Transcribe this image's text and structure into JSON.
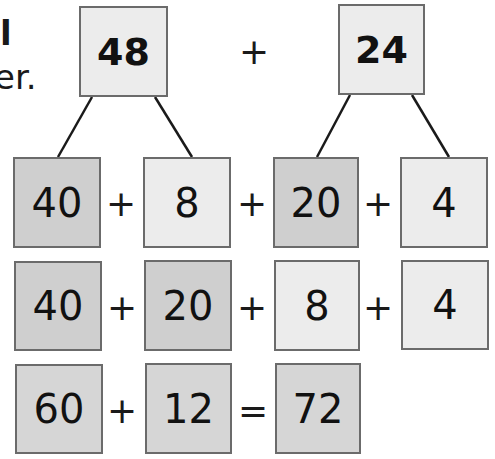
{
  "partial_text": {
    "line1": "l",
    "line2": "er."
  },
  "top": {
    "left_number": "48",
    "operator": "+",
    "right_number": "24"
  },
  "rows": [
    {
      "cells": [
        "40",
        "8",
        "20",
        "4"
      ],
      "operators": [
        "+",
        "+",
        "+"
      ]
    },
    {
      "cells": [
        "40",
        "20",
        "8",
        "4"
      ],
      "operators": [
        "+",
        "+",
        "+"
      ]
    },
    {
      "cells": [
        "60",
        "12",
        "72"
      ],
      "operators": [
        "+",
        "="
      ]
    }
  ],
  "colors": {
    "dark_box": "#cfcfcf",
    "light_box": "#ececec",
    "border": "#6b6b6b",
    "line": "#1a1a1a"
  }
}
